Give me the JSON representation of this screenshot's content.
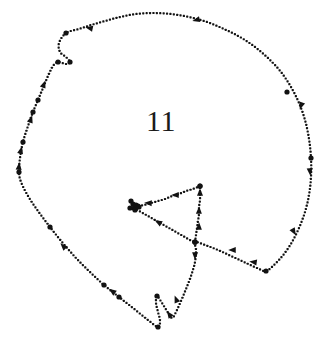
{
  "figure": {
    "kind": "dotted-contour-diagram",
    "label": "11",
    "label_position": {
      "x": 146,
      "y": 106
    },
    "label_font_size_px": 30,
    "canvas": {
      "width": 327,
      "height": 356
    },
    "colors": {
      "background": "#ffffff",
      "ink": "#121212",
      "label": "#1a1a1a"
    },
    "style": {
      "dot_diameter_px": 2.2,
      "dot_spacing_px": 3.4,
      "node_marker_diameter_px": 5.2,
      "arrowhead_length_px": 7.5,
      "arrowhead_width_px": 6
    },
    "paths": [
      {
        "name": "outer-contour",
        "closed": true,
        "description": "main closed dotted outline of the shape",
        "points": [
          [
            66,
            33
          ],
          [
            59,
            43
          ],
          [
            60,
            52
          ],
          [
            66,
            57
          ],
          [
            70,
            62
          ],
          [
            66,
            64
          ],
          [
            58,
            62
          ],
          [
            53,
            66
          ],
          [
            48,
            76
          ],
          [
            43,
            88
          ],
          [
            38,
            100
          ],
          [
            33,
            112
          ],
          [
            28,
            126
          ],
          [
            23,
            142
          ],
          [
            20,
            158
          ],
          [
            19,
            172
          ],
          [
            21,
            182
          ],
          [
            28,
            196
          ],
          [
            38,
            211
          ],
          [
            50,
            227
          ],
          [
            62,
            242
          ],
          [
            76,
            258
          ],
          [
            90,
            272
          ],
          [
            104,
            285
          ],
          [
            119,
            297
          ],
          [
            133,
            308
          ],
          [
            148,
            320
          ],
          [
            158,
            327
          ],
          [
            160,
            321
          ],
          [
            158,
            312
          ],
          [
            156,
            303
          ],
          [
            157,
            296
          ],
          [
            162,
            303
          ],
          [
            167,
            311
          ],
          [
            172,
            318
          ],
          [
            176,
            312
          ],
          [
            181,
            301
          ],
          [
            186,
            289
          ],
          [
            191,
            276
          ],
          [
            195,
            262
          ],
          [
            196,
            250
          ],
          [
            195,
            242
          ],
          [
            205,
            245
          ],
          [
            218,
            250
          ],
          [
            231,
            256
          ],
          [
            244,
            262
          ],
          [
            257,
            268
          ],
          [
            266,
            271
          ],
          [
            275,
            264
          ],
          [
            284,
            254
          ],
          [
            292,
            242
          ],
          [
            299,
            228
          ],
          [
            305,
            212
          ],
          [
            309,
            195
          ],
          [
            311,
            177
          ],
          [
            311,
            158
          ],
          [
            309,
            139
          ],
          [
            305,
            120
          ],
          [
            299,
            103
          ],
          [
            291,
            87
          ],
          [
            281,
            72
          ],
          [
            269,
            59
          ],
          [
            255,
            47
          ],
          [
            240,
            37
          ],
          [
            224,
            29
          ],
          [
            207,
            22
          ],
          [
            189,
            17
          ],
          [
            171,
            14
          ],
          [
            153,
            13
          ],
          [
            136,
            14
          ],
          [
            120,
            17
          ],
          [
            105,
            21
          ],
          [
            91,
            25
          ],
          [
            79,
            29
          ]
        ],
        "nodes": [
          [
            66,
            33
          ],
          [
            70,
            62
          ],
          [
            58,
            62
          ],
          [
            38,
            100
          ],
          [
            33,
            112
          ],
          [
            23,
            142
          ],
          [
            19,
            172
          ],
          [
            50,
            227
          ],
          [
            104,
            285
          ],
          [
            119,
            297
          ],
          [
            157,
            296
          ],
          [
            158,
            327
          ],
          [
            195,
            242
          ],
          [
            266,
            271
          ],
          [
            311,
            158
          ],
          [
            287,
            92
          ]
        ],
        "arrows": [
          {
            "at": [
              44,
              84
            ],
            "angle": 291,
            "label": "up-left"
          },
          {
            "at": [
              31,
              119
            ],
            "angle": 289,
            "label": "up"
          },
          {
            "at": [
              21,
              150
            ],
            "angle": 284,
            "label": "up"
          },
          {
            "at": [
              19,
              166
            ],
            "angle": 276,
            "label": "up"
          },
          {
            "at": [
              63,
              246
            ],
            "angle": 226,
            "label": "up-left"
          },
          {
            "at": [
              112,
              291
            ],
            "angle": 216,
            "label": "up-left"
          },
          {
            "at": [
              169,
              314
            ],
            "angle": 235,
            "label": "up-left"
          },
          {
            "at": [
              176,
              299
            ],
            "angle": 248,
            "label": "up"
          },
          {
            "at": [
              195,
              256
            ],
            "angle": 92,
            "label": "down"
          },
          {
            "at": [
              232,
              250
            ],
            "angle": 180,
            "label": "left"
          },
          {
            "at": [
              253,
              262
            ],
            "angle": 188,
            "label": "left"
          },
          {
            "at": [
              294,
              232
            ],
            "angle": 60,
            "label": "down-right"
          },
          {
            "at": [
              310,
              172
            ],
            "angle": 85,
            "label": "down"
          },
          {
            "at": [
              301,
              106
            ],
            "angle": 110,
            "label": "down"
          },
          {
            "at": [
              196,
              20
            ],
            "angle": 166,
            "label": "left"
          },
          {
            "at": [
              89,
              28
            ],
            "angle": 192,
            "label": "left"
          }
        ]
      },
      {
        "name": "inner-triangle-top-edge",
        "closed": false,
        "description": "edge from triangle apex to left vertex cluster",
        "points": [
          [
            200,
            186
          ],
          [
            193,
            189
          ],
          [
            186,
            191
          ],
          [
            179,
            194
          ],
          [
            172,
            196
          ],
          [
            165,
            199
          ],
          [
            158,
            201
          ],
          [
            151,
            203
          ],
          [
            144,
            205
          ],
          [
            138,
            206
          ]
        ],
        "nodes": [
          [
            200,
            186
          ],
          [
            138,
            206
          ]
        ],
        "arrows": [
          {
            "at": [
              175,
              195
            ],
            "angle": 180,
            "label": "left"
          },
          {
            "at": [
              148,
              203
            ],
            "angle": 183,
            "label": "left"
          }
        ]
      },
      {
        "name": "inner-triangle-lower-edge",
        "closed": false,
        "description": "edge from left vertex cluster down-right to junction",
        "points": [
          [
            134,
            208
          ],
          [
            141,
            212
          ],
          [
            148,
            216
          ],
          [
            155,
            220
          ],
          [
            162,
            224
          ],
          [
            169,
            228
          ],
          [
            176,
            232
          ],
          [
            183,
            236
          ],
          [
            190,
            240
          ],
          [
            195,
            242
          ]
        ],
        "nodes": [
          [
            134,
            208
          ],
          [
            195,
            242
          ]
        ],
        "arrows": [
          {
            "at": [
              158,
              222
            ],
            "angle": 210,
            "label": "up-left"
          }
        ]
      },
      {
        "name": "inner-triangle-right-edge",
        "closed": false,
        "description": "vertical edge from junction up to triangle apex",
        "points": [
          [
            195,
            242
          ],
          [
            196,
            235
          ],
          [
            197,
            228
          ],
          [
            198,
            221
          ],
          [
            199,
            214
          ],
          [
            199,
            207
          ],
          [
            200,
            200
          ],
          [
            200,
            193
          ],
          [
            200,
            186
          ]
        ],
        "nodes": [
          [
            195,
            242
          ],
          [
            200,
            186
          ]
        ],
        "arrows": [
          {
            "at": [
              199,
              226
            ],
            "angle": 272,
            "label": "up"
          },
          {
            "at": [
              199,
              210
            ],
            "angle": 272,
            "label": "up"
          },
          {
            "at": [
              200,
              192
            ],
            "angle": 270,
            "label": "up"
          }
        ]
      },
      {
        "name": "left-vertex-cluster",
        "closed": false,
        "description": "dense cluster of node markers at the triangle left vertex",
        "points": [],
        "nodes": [
          [
            131,
            201
          ],
          [
            136,
            205
          ],
          [
            130,
            208
          ],
          [
            135,
            210
          ],
          [
            139,
            207
          ],
          [
            133,
            204
          ]
        ],
        "arrows": []
      }
    ]
  }
}
